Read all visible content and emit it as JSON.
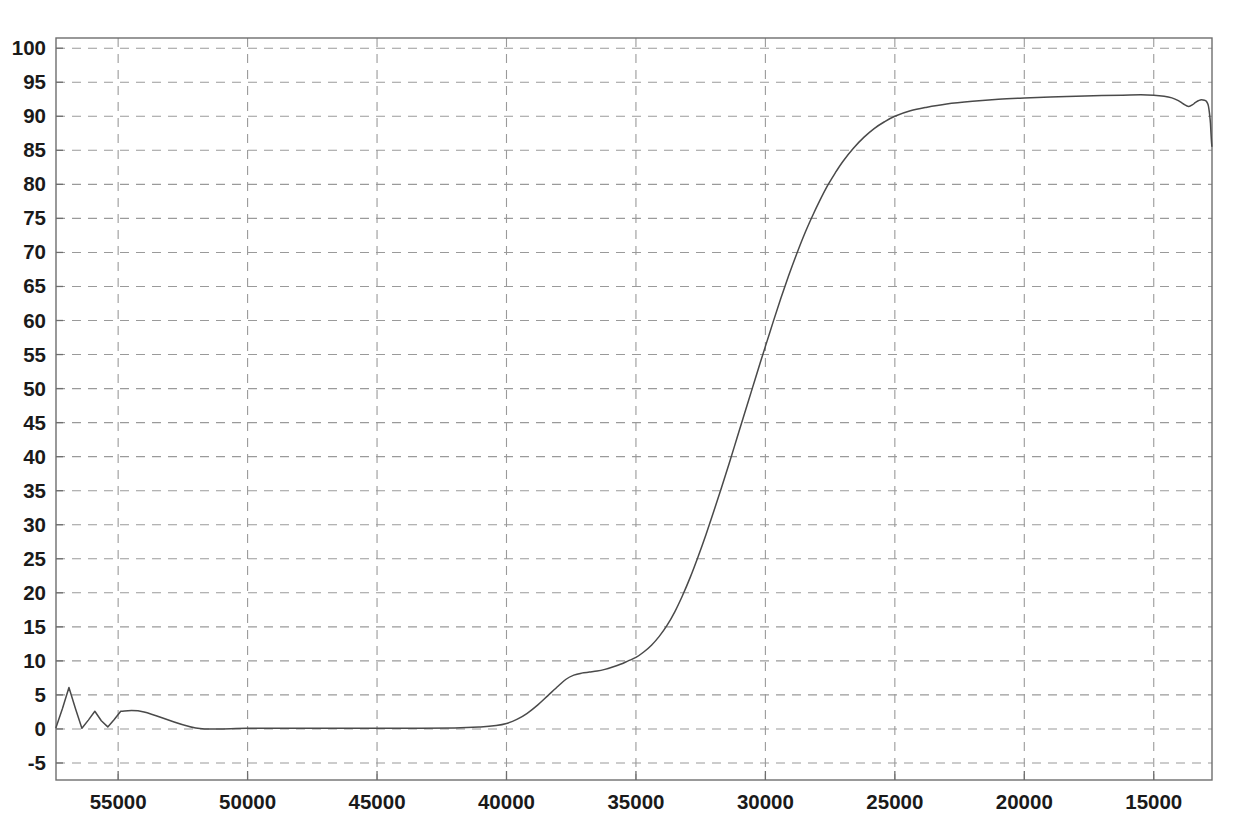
{
  "chart_data": {
    "type": "line",
    "title": "",
    "subtitle": "",
    "xlabel": "",
    "ylabel": "",
    "xlim": [
      57400,
      12750
    ],
    "ylim": [
      -7.5,
      101.5
    ],
    "x_axis_reversed": true,
    "grid": true,
    "legend": "none",
    "xticks": [
      55000,
      50000,
      45000,
      40000,
      35000,
      30000,
      25000,
      20000,
      15000
    ],
    "xtick_labels": [
      "55000",
      "50000",
      "45000",
      "40000",
      "35000",
      "30000",
      "25000",
      "20000",
      "15000"
    ],
    "yticks": [
      -5,
      0,
      5,
      10,
      15,
      20,
      25,
      30,
      35,
      40,
      45,
      50,
      55,
      60,
      65,
      70,
      75,
      80,
      85,
      90,
      95,
      100
    ],
    "ytick_labels": [
      "-5",
      "0",
      "5",
      "10",
      "15",
      "20",
      "25",
      "30",
      "35",
      "40",
      "45",
      "50",
      "55",
      "60",
      "65",
      "70",
      "75",
      "80",
      "85",
      "90",
      "95",
      "100"
    ],
    "series": [
      {
        "name": "transmittance",
        "color": "#4a4a4a",
        "x": [
          57400,
          57150,
          56900,
          56650,
          56400,
          56150,
          55900,
          55650,
          55400,
          55150,
          54900,
          54000,
          52000,
          50000,
          48000,
          46000,
          44000,
          42000,
          41000,
          40400,
          40000,
          39600,
          39200,
          38800,
          38400,
          38000,
          37700,
          37400,
          37100,
          36800,
          36500,
          36200,
          35900,
          35600,
          35300,
          35000,
          34700,
          34400,
          34100,
          33800,
          33500,
          33200,
          32900,
          32600,
          32300,
          32000,
          31700,
          31400,
          31100,
          30800,
          30500,
          30200,
          30000,
          29700,
          29400,
          29100,
          28800,
          28500,
          28200,
          27900,
          27600,
          27300,
          27000,
          26600,
          26200,
          25800,
          25400,
          25000,
          24400,
          23800,
          23000,
          22000,
          21000,
          20000,
          19000,
          18000,
          17000,
          16200,
          15500,
          15000,
          14600,
          14300,
          14050,
          13850,
          13650,
          13500,
          13400,
          13300,
          13200,
          13100,
          13000,
          12950,
          12900,
          12870,
          12840,
          12810,
          12790,
          12770,
          12755
        ],
        "y": [
          0.2,
          3.0,
          6.1,
          3.0,
          0.1,
          1.3,
          2.6,
          1.2,
          0.3,
          1.4,
          2.6,
          2.5,
          0.15,
          0.1,
          0.1,
          0.1,
          0.1,
          0.15,
          0.3,
          0.5,
          0.8,
          1.4,
          2.3,
          3.5,
          4.9,
          6.3,
          7.3,
          7.9,
          8.2,
          8.35,
          8.5,
          8.75,
          9.1,
          9.5,
          10.0,
          10.5,
          11.3,
          12.3,
          13.6,
          15.2,
          17.2,
          19.6,
          22.3,
          25.3,
          28.5,
          31.9,
          35.4,
          39.0,
          42.7,
          46.4,
          50.1,
          53.8,
          56.2,
          59.8,
          63.3,
          66.6,
          69.7,
          72.6,
          75.2,
          77.6,
          79.8,
          81.7,
          83.4,
          85.3,
          86.9,
          88.2,
          89.2,
          90.0,
          90.8,
          91.3,
          91.8,
          92.2,
          92.5,
          92.7,
          92.85,
          92.95,
          93.05,
          93.1,
          93.15,
          93.1,
          92.95,
          92.7,
          92.3,
          91.8,
          91.45,
          91.7,
          92.0,
          92.25,
          92.4,
          92.4,
          92.3,
          92.1,
          91.7,
          91.1,
          90.2,
          89.0,
          87.6,
          86.3,
          85.6
        ]
      }
    ],
    "annotations": {
      "noise_region": "oscillating baseline artifact between 57400 and 54900",
      "shoulder": "plateau near 8.2 around 37100-36500",
      "plateau_max": 93.15,
      "edge_dropoff": "sharp decline below 13000"
    }
  },
  "colors": {
    "background": "#ffffff",
    "grid": "#9a9a9a",
    "frame": "#6e6e6e",
    "curve": "#4a4a4a",
    "text": "#1a1a1a"
  },
  "plot_geometry": {
    "left": 56,
    "right": 1212,
    "top": 38,
    "bottom": 780
  }
}
